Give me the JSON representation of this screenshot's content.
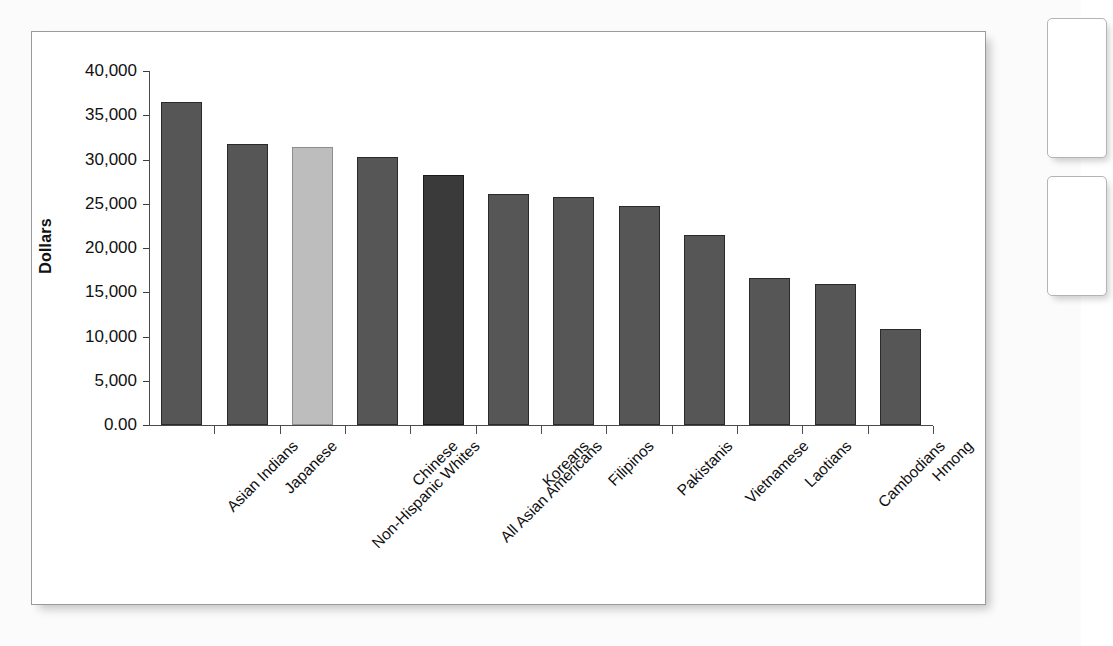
{
  "figure": {
    "panel_name": "chart-figure-panel"
  },
  "chart_data": {
    "type": "bar",
    "title": "",
    "xlabel": "",
    "ylabel": "Dollars",
    "ylim": [
      0,
      40000
    ],
    "grid": false,
    "legend": "none",
    "ytick_labels": [
      "40,000",
      "35,000",
      "30,000",
      "25,000",
      "20,000",
      "15,000",
      "10,000",
      "5,000",
      "0.00"
    ],
    "ytick_values": [
      40000,
      35000,
      30000,
      25000,
      20000,
      15000,
      10000,
      5000,
      0
    ],
    "categories": [
      "Asian Indians",
      "Japanese",
      "Non-Hispanic Whites",
      "Chinese",
      "All Asian Americans",
      "Koreans",
      "Filipinos",
      "Pakistanis",
      "Vietnamese",
      "Laotians",
      "Cambodians",
      "Hmong"
    ],
    "values": [
      36500,
      31800,
      31400,
      30300,
      28300,
      26100,
      25800,
      24700,
      21500,
      16600,
      15900,
      10900
    ],
    "bar_styles": [
      "standard",
      "standard",
      "highlight-light",
      "standard",
      "highlight-dark",
      "standard",
      "standard",
      "standard",
      "standard",
      "standard",
      "standard",
      "standard"
    ],
    "colors": {
      "standard": "#565656",
      "highlight_light": "#bdbdbd",
      "highlight_dark": "#3a3a3a",
      "axis": "#4a4a4a",
      "text": "#101010"
    }
  }
}
